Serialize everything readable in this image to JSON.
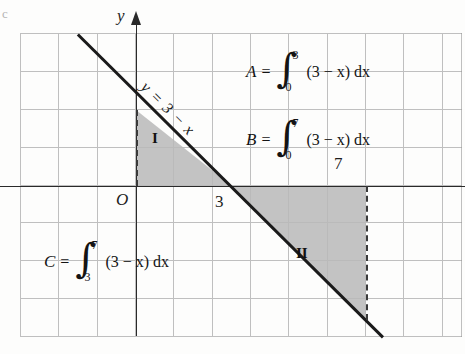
{
  "figure": {
    "corner_mark": "c",
    "axes": {
      "y_axis_label": "y",
      "origin_label": "O",
      "x_tick_3": "3",
      "x_tick_7": "7"
    },
    "line_equation": "y = 3 − x",
    "regions": [
      {
        "id": "I",
        "label": "I",
        "fill_color": "#b9b9b9",
        "x_range": [
          0,
          3
        ],
        "position": "above x-axis"
      },
      {
        "id": "II",
        "label": "II",
        "fill_color": "#b9b9b9",
        "x_range": [
          3,
          7
        ],
        "position": "below x-axis"
      }
    ],
    "formulas": [
      {
        "name": "A",
        "equals": "=",
        "upper_limit": "3",
        "lower_limit": "0",
        "integrand": "(3 − x) dx"
      },
      {
        "name": "B",
        "equals": "=",
        "upper_limit": "7",
        "lower_limit": "0",
        "integrand": "(3 − x) dx"
      },
      {
        "name": "C",
        "equals": "=",
        "upper_limit": "7",
        "lower_limit": "3",
        "integrand": "(3 − x) dx"
      }
    ]
  },
  "chart_data": {
    "type": "line",
    "title": "",
    "xlabel": "x",
    "ylabel": "y",
    "equation": "y = 3 - x",
    "slope": -1,
    "intercept": 3,
    "x": [
      0,
      3,
      7
    ],
    "y": [
      3,
      0,
      -4
    ],
    "xlim": [
      -3,
      8.5
    ],
    "ylim": [
      -4,
      4
    ],
    "grid": true,
    "legend": "none",
    "shaded_regions": [
      {
        "label": "I",
        "x_from": 0,
        "x_to": 3,
        "signed_area": 4.5
      },
      {
        "label": "II",
        "x_from": 3,
        "x_to": 7,
        "signed_area": -8
      }
    ],
    "annotations": [
      "A = ∫_0^3 (3 − x) dx",
      "B = ∫_0^7 (3 − x) dx",
      "C = ∫_3^7 (3 − x) dx"
    ],
    "tick_labels": {
      "x": [
        "O",
        "3",
        "7"
      ]
    }
  }
}
